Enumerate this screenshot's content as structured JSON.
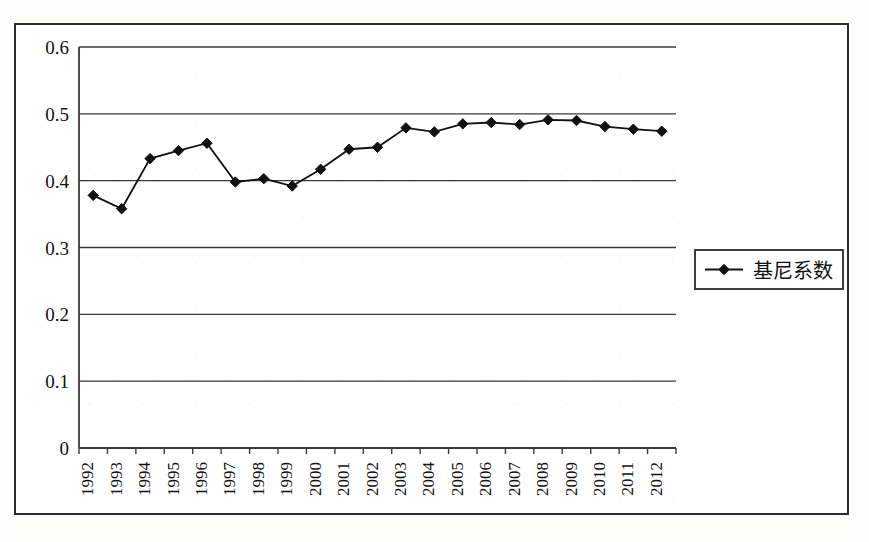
{
  "figure": {
    "frame_border_color": "#2b2b2b",
    "background_color": "#ffffff",
    "line_color": "#111111",
    "grid_color": "#3a3a3a"
  },
  "legend": {
    "entries": [
      {
        "label": "基尼系数",
        "marker": "diamond-marker",
        "color": "#111111"
      }
    ],
    "position": "right"
  },
  "axes": {
    "y_ticks": [
      "0.6",
      "0.5",
      "0.4",
      "0.3",
      "0.2",
      "0.1",
      "0"
    ],
    "x_ticks": [
      "1992",
      "1993",
      "1994",
      "1995",
      "1996",
      "1997",
      "1998",
      "1999",
      "2000",
      "2001",
      "2002",
      "2003",
      "2004",
      "2005",
      "2006",
      "2007",
      "2008",
      "2009",
      "2010",
      "2011",
      "2012"
    ],
    "x_tick_rotation": "-90"
  },
  "chart_data": {
    "type": "line",
    "title": "",
    "subtitle": "",
    "xlabel": "",
    "ylabel": "",
    "ylim": [
      0,
      0.6
    ],
    "ytick_step": 0.1,
    "grid": true,
    "legend_position": "right",
    "marker": "diamond",
    "categories": [
      "1992",
      "1993",
      "1994",
      "1995",
      "1996",
      "1997",
      "1998",
      "1999",
      "2000",
      "2001",
      "2002",
      "2003",
      "2004",
      "2005",
      "2006",
      "2007",
      "2008",
      "2009",
      "2010",
      "2011",
      "2012"
    ],
    "series": [
      {
        "name": "基尼系数",
        "color": "#111111",
        "values": [
          0.378,
          0.358,
          0.433,
          0.445,
          0.456,
          0.398,
          0.403,
          0.392,
          0.417,
          0.447,
          0.45,
          0.479,
          0.473,
          0.485,
          0.487,
          0.484,
          0.491,
          0.49,
          0.481,
          0.477,
          0.474
        ]
      }
    ]
  }
}
